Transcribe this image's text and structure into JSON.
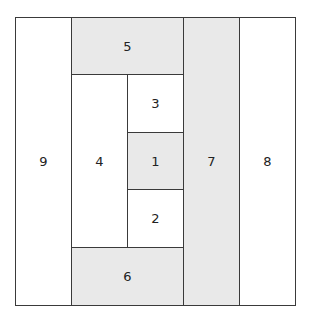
{
  "diagram": {
    "type": "rectangle-partition",
    "cells": [
      {
        "id": "9",
        "label": "9",
        "fill": "white",
        "x": 15,
        "y": 17,
        "w": 57,
        "h": 289
      },
      {
        "id": "5",
        "label": "5",
        "fill": "gray",
        "x": 71,
        "y": 17,
        "w": 113,
        "h": 58
      },
      {
        "id": "4",
        "label": "4",
        "fill": "white",
        "x": 71,
        "y": 74,
        "w": 57,
        "h": 174
      },
      {
        "id": "3",
        "label": "3",
        "fill": "white",
        "x": 127,
        "y": 74,
        "w": 57,
        "h": 59
      },
      {
        "id": "1",
        "label": "1",
        "fill": "gray",
        "x": 127,
        "y": 132,
        "w": 57,
        "h": 58
      },
      {
        "id": "2",
        "label": "2",
        "fill": "white",
        "x": 127,
        "y": 189,
        "w": 57,
        "h": 59
      },
      {
        "id": "6",
        "label": "6",
        "fill": "gray",
        "x": 71,
        "y": 247,
        "w": 113,
        "h": 59
      },
      {
        "id": "7",
        "label": "7",
        "fill": "gray",
        "x": 183,
        "y": 17,
        "w": 57,
        "h": 289
      },
      {
        "id": "8",
        "label": "8",
        "fill": "white",
        "x": 239,
        "y": 17,
        "w": 57,
        "h": 289
      }
    ],
    "colors": {
      "gray": "#e9e9e9",
      "white": "#ffffff",
      "border": "#3a3a3a"
    }
  }
}
